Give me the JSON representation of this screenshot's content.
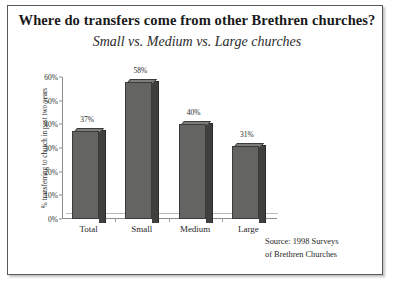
{
  "chart_data": {
    "type": "bar",
    "title": "Where do transfers come from other Brethren churches?",
    "subtitle": "Small vs. Medium vs. Large churches",
    "xlabel": "",
    "ylabel": "% transferring to church in past two years",
    "categories": [
      "Total",
      "Small",
      "Medium",
      "Large"
    ],
    "values": [
      37,
      58,
      40,
      31
    ],
    "value_labels": [
      "37%",
      "58%",
      "40%",
      "31%"
    ],
    "ylim": [
      0,
      60
    ],
    "yticks": [
      60,
      50,
      40,
      30,
      20,
      10,
      0
    ],
    "ytick_labels": [
      "60%",
      "50%",
      "40%",
      "30%",
      "20%",
      "10%",
      "0%"
    ],
    "grid": false,
    "legend": "none",
    "style": "3d-column",
    "source_note": "Source: 1998 Surveys of Brethren Churches",
    "source_lines": [
      "Source: 1998 Surveys",
      "of Brethren Churches"
    ],
    "colors": {
      "bar_face": "#646462",
      "bar_side": "#3f3f3d",
      "bar_top": "#7d7d7b",
      "axis": "#8d8d8b",
      "text": "#1f1f1f",
      "frame": "#5a5a58"
    }
  }
}
